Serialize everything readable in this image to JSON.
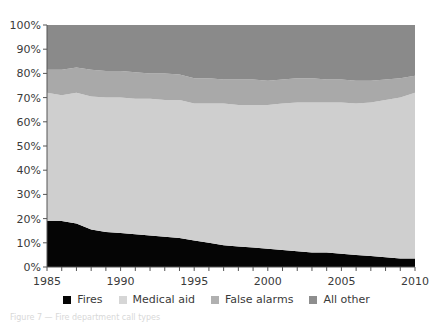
{
  "chart_data": {
    "type": "area",
    "stacked": true,
    "normalized_percent": true,
    "title": "",
    "xlabel": "",
    "ylabel": "",
    "x": [
      1985,
      1986,
      1987,
      1988,
      1989,
      1990,
      1991,
      1992,
      1993,
      1994,
      1995,
      1996,
      1997,
      1998,
      1999,
      2000,
      2001,
      2002,
      2003,
      2004,
      2005,
      2006,
      2007,
      2008,
      2009,
      2010
    ],
    "series": [
      {
        "name": "Fires",
        "color": "#050505",
        "values": [
          19,
          19,
          18,
          15.5,
          14.5,
          14,
          13.5,
          13,
          12.5,
          12,
          11,
          10,
          9,
          8.5,
          8,
          7.5,
          7,
          6.5,
          6,
          6,
          5.5,
          5,
          4.5,
          4,
          3.5,
          3.5
        ]
      },
      {
        "name": "Medical aid",
        "color": "#cfcfcf",
        "values": [
          53,
          52,
          54,
          55,
          55.5,
          56,
          56,
          56.5,
          56.5,
          57,
          56.5,
          57.5,
          58.5,
          58.5,
          59,
          59.5,
          60.5,
          61.5,
          62,
          62,
          62.5,
          62.5,
          63.5,
          65,
          66.5,
          68.5
        ]
      },
      {
        "name": "False alarms",
        "color": "#a9a9a9",
        "values": [
          9.5,
          10.5,
          10.5,
          11,
          11,
          11,
          11,
          10.5,
          11,
          10.5,
          10.5,
          10.5,
          10,
          10.5,
          10.5,
          10,
          10,
          10,
          10,
          9.5,
          9.5,
          9.5,
          9,
          8.5,
          8,
          7
        ]
      },
      {
        "name": "All other",
        "color": "#8a8a8a",
        "values": [
          18.5,
          18.5,
          17.5,
          18.5,
          19,
          19,
          19.5,
          20,
          20,
          20.5,
          22,
          22,
          22.5,
          22.5,
          22.5,
          23,
          22.5,
          22,
          22,
          22.5,
          22.5,
          23,
          23,
          22.5,
          22,
          21
        ]
      }
    ],
    "ylim": [
      0,
      100
    ],
    "xlim": [
      1985,
      2010
    ],
    "yticks": [
      "0%",
      "10%",
      "20%",
      "30%",
      "40%",
      "50%",
      "60%",
      "70%",
      "80%",
      "90%",
      "100%"
    ],
    "xticks": [
      "1985",
      "1990",
      "1995",
      "2000",
      "2005",
      "2010"
    ],
    "grid": false,
    "legend_position": "bottom"
  },
  "legend": {
    "items": [
      {
        "label": "Fires",
        "color": "#050505"
      },
      {
        "label": "Medical aid",
        "color": "#d6d6d6"
      },
      {
        "label": "False alarms",
        "color": "#b0b0b0"
      },
      {
        "label": "All other",
        "color": "#8e8e8e"
      }
    ]
  },
  "caption": "Figure 7 — Fire department call types"
}
